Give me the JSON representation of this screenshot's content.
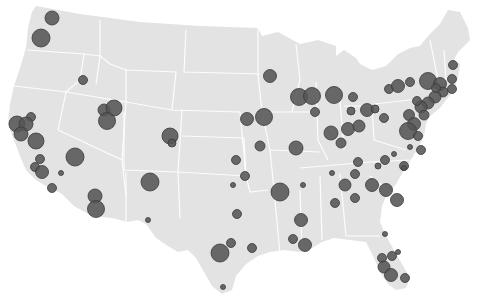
{
  "map": {
    "type": "proportional-symbol",
    "region": "Contiguous United States",
    "land_color": "#e3e3e3",
    "border_color": "#ffffff",
    "marker_fill": "#555555",
    "marker_stroke": "#3a3a3a",
    "marker_opacity": 0.88
  },
  "markers": [
    {
      "x": 52,
      "y": 18,
      "r": 7
    },
    {
      "x": 41,
      "y": 38,
      "r": 9
    },
    {
      "x": 83,
      "y": 80,
      "r": 4.5
    },
    {
      "x": 31,
      "y": 117,
      "r": 4.5
    },
    {
      "x": 17,
      "y": 124,
      "r": 8
    },
    {
      "x": 26,
      "y": 124,
      "r": 7
    },
    {
      "x": 21,
      "y": 134,
      "r": 7
    },
    {
      "x": 36,
      "y": 141,
      "r": 8
    },
    {
      "x": 75,
      "y": 157,
      "r": 9
    },
    {
      "x": 40,
      "y": 159,
      "r": 4.5
    },
    {
      "x": 35,
      "y": 167,
      "r": 4.5
    },
    {
      "x": 42,
      "y": 172,
      "r": 6.5
    },
    {
      "x": 61,
      "y": 173,
      "r": 2.5
    },
    {
      "x": 52,
      "y": 188,
      "r": 4.5
    },
    {
      "x": 104,
      "y": 110,
      "r": 6
    },
    {
      "x": 114,
      "y": 108,
      "r": 8
    },
    {
      "x": 107,
      "y": 121,
      "r": 8.5
    },
    {
      "x": 170,
      "y": 136,
      "r": 8
    },
    {
      "x": 172,
      "y": 143,
      "r": 4
    },
    {
      "x": 95,
      "y": 196,
      "r": 7
    },
    {
      "x": 96,
      "y": 209,
      "r": 8.5
    },
    {
      "x": 150,
      "y": 182,
      "r": 9
    },
    {
      "x": 148,
      "y": 220,
      "r": 2.5
    },
    {
      "x": 270,
      "y": 76,
      "r": 6.5
    },
    {
      "x": 247,
      "y": 119,
      "r": 6.5
    },
    {
      "x": 264,
      "y": 117,
      "r": 8.5
    },
    {
      "x": 260,
      "y": 146,
      "r": 5
    },
    {
      "x": 299,
      "y": 97,
      "r": 8.5
    },
    {
      "x": 312,
      "y": 96,
      "r": 8.5
    },
    {
      "x": 334,
      "y": 95,
      "r": 8.5
    },
    {
      "x": 353,
      "y": 97,
      "r": 4.5
    },
    {
      "x": 315,
      "y": 112,
      "r": 4.5
    },
    {
      "x": 351,
      "y": 111,
      "r": 4
    },
    {
      "x": 367,
      "y": 110,
      "r": 6.5
    },
    {
      "x": 375,
      "y": 109,
      "r": 4
    },
    {
      "x": 384,
      "y": 118,
      "r": 4.5
    },
    {
      "x": 331,
      "y": 133,
      "r": 7
    },
    {
      "x": 348,
      "y": 129,
      "r": 6.5
    },
    {
      "x": 359,
      "y": 126,
      "r": 6
    },
    {
      "x": 341,
      "y": 143,
      "r": 5
    },
    {
      "x": 296,
      "y": 148,
      "r": 7
    },
    {
      "x": 236,
      "y": 160,
      "r": 4.5
    },
    {
      "x": 233,
      "y": 185,
      "r": 2.5
    },
    {
      "x": 245,
      "y": 176,
      "r": 4.5
    },
    {
      "x": 237,
      "y": 214,
      "r": 4.5
    },
    {
      "x": 280,
      "y": 192,
      "r": 9
    },
    {
      "x": 303,
      "y": 185,
      "r": 2.5
    },
    {
      "x": 332,
      "y": 173,
      "r": 2.5
    },
    {
      "x": 345,
      "y": 185,
      "r": 6
    },
    {
      "x": 355,
      "y": 174,
      "r": 4.5
    },
    {
      "x": 358,
      "y": 162,
      "r": 4.5
    },
    {
      "x": 372,
      "y": 185,
      "r": 6.5
    },
    {
      "x": 386,
      "y": 190,
      "r": 6.5
    },
    {
      "x": 397,
      "y": 200,
      "r": 6.5
    },
    {
      "x": 378,
      "y": 166,
      "r": 3
    },
    {
      "x": 385,
      "y": 160,
      "r": 4.5
    },
    {
      "x": 394,
      "y": 154,
      "r": 2.5
    },
    {
      "x": 404,
      "y": 166,
      "r": 4.5
    },
    {
      "x": 335,
      "y": 203,
      "r": 4.5
    },
    {
      "x": 355,
      "y": 198,
      "r": 4.5
    },
    {
      "x": 301,
      "y": 220,
      "r": 6.5
    },
    {
      "x": 293,
      "y": 239,
      "r": 4.5
    },
    {
      "x": 305,
      "y": 245,
      "r": 6.5
    },
    {
      "x": 252,
      "y": 248,
      "r": 4.5
    },
    {
      "x": 231,
      "y": 243,
      "r": 4.5
    },
    {
      "x": 220,
      "y": 253,
      "r": 9
    },
    {
      "x": 223,
      "y": 287,
      "r": 2.5
    },
    {
      "x": 385,
      "y": 234,
      "r": 2.5
    },
    {
      "x": 382,
      "y": 258,
      "r": 4.5
    },
    {
      "x": 392,
      "y": 256,
      "r": 4.5
    },
    {
      "x": 398,
      "y": 252,
      "r": 2.5
    },
    {
      "x": 384,
      "y": 267,
      "r": 6
    },
    {
      "x": 391,
      "y": 275,
      "r": 6.5
    },
    {
      "x": 405,
      "y": 278,
      "r": 4.5
    },
    {
      "x": 389,
      "y": 89,
      "r": 4.5
    },
    {
      "x": 398,
      "y": 86,
      "r": 6.5
    },
    {
      "x": 410,
      "y": 82,
      "r": 4.5
    },
    {
      "x": 428,
      "y": 81,
      "r": 8.5
    },
    {
      "x": 440,
      "y": 84,
      "r": 6.5
    },
    {
      "x": 453,
      "y": 65,
      "r": 4.5
    },
    {
      "x": 452,
      "y": 79,
      "r": 4.5
    },
    {
      "x": 452,
      "y": 89,
      "r": 4.5
    },
    {
      "x": 443,
      "y": 92,
      "r": 5
    },
    {
      "x": 435,
      "y": 97,
      "r": 6
    },
    {
      "x": 428,
      "y": 103,
      "r": 6
    },
    {
      "x": 421,
      "y": 107,
      "r": 6
    },
    {
      "x": 417,
      "y": 101,
      "r": 4.5
    },
    {
      "x": 436,
      "y": 88,
      "r": 4.5
    },
    {
      "x": 409,
      "y": 115,
      "r": 5.5
    },
    {
      "x": 414,
      "y": 124,
      "r": 6.5
    },
    {
      "x": 408,
      "y": 131,
      "r": 8.5
    },
    {
      "x": 424,
      "y": 115,
      "r": 5
    },
    {
      "x": 418,
      "y": 136,
      "r": 4.5
    },
    {
      "x": 410,
      "y": 147,
      "r": 2.5
    },
    {
      "x": 421,
      "y": 150,
      "r": 4.5
    },
    {
      "x": 404,
      "y": 168,
      "r": 2.5
    }
  ]
}
